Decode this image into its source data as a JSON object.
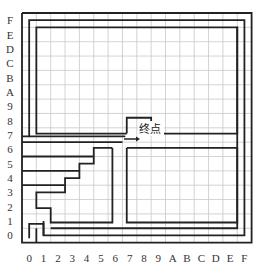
{
  "diagram": {
    "title": "",
    "end_label": "终点",
    "x_labels": [
      "0",
      "1",
      "2",
      "3",
      "4",
      "5",
      "6",
      "7",
      "8",
      "9",
      "A",
      "B",
      "C",
      "D",
      "E",
      "F"
    ],
    "y_labels": [
      "F",
      "E",
      "D",
      "C",
      "B",
      "A",
      "9",
      "8",
      "7",
      "6",
      "5",
      "4",
      "3",
      "2",
      "1",
      "0"
    ],
    "grid_size": 16,
    "colors": {
      "grid": "#c8c8c8",
      "wall": "#222222",
      "label": "#333333"
    }
  }
}
